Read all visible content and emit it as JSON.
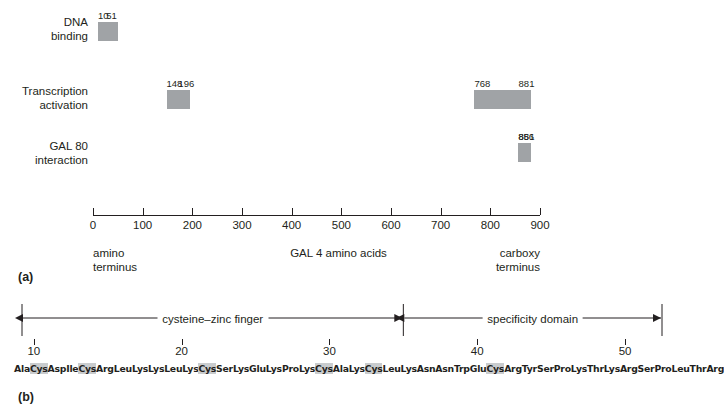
{
  "figure": {
    "panel_a_label": "(a)",
    "panel_b_label": "(b)"
  },
  "panel_a": {
    "rows": [
      {
        "name": "dna-binding",
        "label": "DNA\nbinding",
        "start": 10,
        "end": 51
      },
      {
        "name": "transcription-activation-n",
        "label": "Transcription\nactivation",
        "start": 148,
        "end": 196
      },
      {
        "name": "transcription-activation-c",
        "label": "",
        "start": 768,
        "end": 881
      },
      {
        "name": "gal80-interaction",
        "label": "GAL 80\ninteraction",
        "start": 856,
        "end": 881
      }
    ],
    "axis": {
      "min": 0,
      "max": 900,
      "ticks": [
        0,
        100,
        200,
        300,
        400,
        500,
        600,
        700,
        800,
        900
      ],
      "tick_labels": [
        "0",
        "100",
        "200",
        "300",
        "400",
        "500",
        "600",
        "700",
        "800",
        "900"
      ],
      "title": "GAL 4 amino acids",
      "left_caption": "amino\nterminus",
      "right_caption": "carboxy\nterminus"
    },
    "segment_color": "#a0a3a6"
  },
  "panel_b": {
    "domains": [
      {
        "name": "cysteine-zinc-finger",
        "label": "cysteine–zinc finger",
        "start": 9.2,
        "end": 35.0
      },
      {
        "name": "specificity-domain",
        "label": "specificity domain",
        "start": 35.0,
        "end": 52.5
      }
    ],
    "scale": {
      "min": 9.2,
      "max": 52.5,
      "ticks": [
        10,
        20,
        30,
        40,
        50
      ],
      "tick_labels": [
        "10",
        "20",
        "30",
        "40",
        "50"
      ]
    },
    "sequence": [
      {
        "aa": "Ala",
        "hl": false
      },
      {
        "aa": "Cys",
        "hl": true
      },
      {
        "aa": "Asp",
        "hl": false
      },
      {
        "aa": "Ile",
        "hl": false
      },
      {
        "aa": "Cys",
        "hl": true
      },
      {
        "aa": "Arg",
        "hl": false
      },
      {
        "aa": "Leu",
        "hl": false
      },
      {
        "aa": "Lys",
        "hl": false
      },
      {
        "aa": "Lys",
        "hl": false
      },
      {
        "aa": "Leu",
        "hl": false
      },
      {
        "aa": "Lys",
        "hl": false
      },
      {
        "aa": "Cys",
        "hl": true
      },
      {
        "aa": "Ser",
        "hl": false
      },
      {
        "aa": "Lys",
        "hl": false
      },
      {
        "aa": "Glu",
        "hl": false
      },
      {
        "aa": "Lys",
        "hl": false
      },
      {
        "aa": "Pro",
        "hl": false
      },
      {
        "aa": "Lys",
        "hl": false
      },
      {
        "aa": "Cys",
        "hl": true
      },
      {
        "aa": "Ala",
        "hl": false
      },
      {
        "aa": "Lys",
        "hl": false
      },
      {
        "aa": "Cys",
        "hl": true
      },
      {
        "aa": "Leu",
        "hl": false
      },
      {
        "aa": "Lys",
        "hl": false
      },
      {
        "aa": "Asn",
        "hl": false
      },
      {
        "aa": "Asn",
        "hl": false
      },
      {
        "aa": "Trp",
        "hl": false
      },
      {
        "aa": "Glu",
        "hl": false
      },
      {
        "aa": "Cys",
        "hl": true
      },
      {
        "aa": "Arg",
        "hl": false
      },
      {
        "aa": "Tyr",
        "hl": false
      },
      {
        "aa": "Ser",
        "hl": false
      },
      {
        "aa": "Pro",
        "hl": false
      },
      {
        "aa": "Lys",
        "hl": false
      },
      {
        "aa": "Thr",
        "hl": false
      },
      {
        "aa": "Lys",
        "hl": false
      },
      {
        "aa": "Arg",
        "hl": false
      },
      {
        "aa": "Ser",
        "hl": false
      },
      {
        "aa": "Pro",
        "hl": false
      },
      {
        "aa": "Leu",
        "hl": false
      },
      {
        "aa": "Thr",
        "hl": false
      },
      {
        "aa": "Arg",
        "hl": false
      }
    ]
  }
}
